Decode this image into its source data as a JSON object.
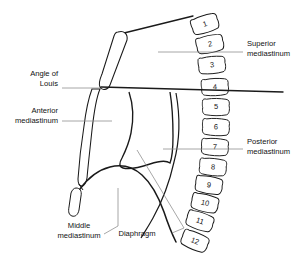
{
  "diagram": {
    "stroke_color": "#1a1a1a",
    "leader_color": "#8a8a8a",
    "background": "#ffffff",
    "vertebrae": [
      {
        "label": "1",
        "cx": 205,
        "cy": 24,
        "rot": -18
      },
      {
        "label": "2",
        "cx": 210,
        "cy": 44,
        "rot": -12
      },
      {
        "label": "3",
        "cx": 212,
        "cy": 65,
        "rot": -6
      },
      {
        "label": "4",
        "cx": 215,
        "cy": 87,
        "rot": -3
      },
      {
        "label": "5",
        "cx": 216,
        "cy": 107,
        "rot": 0
      },
      {
        "label": "6",
        "cx": 216,
        "cy": 127,
        "rot": 2
      },
      {
        "label": "7",
        "cx": 215,
        "cy": 147,
        "rot": 3
      },
      {
        "label": "8",
        "cx": 213,
        "cy": 167,
        "rot": 5
      },
      {
        "label": "9",
        "cx": 209,
        "cy": 185,
        "rot": 9
      },
      {
        "label": "10",
        "cx": 205,
        "cy": 203,
        "rot": 13
      },
      {
        "label": "11",
        "cx": 200,
        "cy": 221,
        "rot": 18
      },
      {
        "label": "12",
        "cx": 195,
        "cy": 241,
        "rot": 22
      }
    ],
    "annotations": [
      {
        "name": "superior-mediastinum",
        "lines": [
          "Superior",
          "mediastinum"
        ],
        "text_x": 247,
        "text_y": 46,
        "align": "start",
        "leader": [
          [
            158,
            52
          ],
          [
            243,
            52
          ]
        ]
      },
      {
        "name": "posterior-mediastinum",
        "lines": [
          "Posterior",
          "mediastinum"
        ],
        "text_x": 247,
        "text_y": 144,
        "align": "start",
        "leader": [
          [
            163,
            149
          ],
          [
            243,
            149
          ]
        ]
      },
      {
        "name": "angle-of-louis",
        "lines": [
          "Angle of",
          "Louis"
        ],
        "text_x": 58,
        "text_y": 76,
        "align": "end",
        "leader": [
          [
            62,
            88
          ],
          [
            100,
            88
          ]
        ]
      },
      {
        "name": "anterior-mediastinum",
        "lines": [
          "Anterior",
          "mediastinum"
        ],
        "text_x": 58,
        "text_y": 113,
        "align": "end",
        "leader": [
          [
            62,
            121
          ],
          [
            112,
            121
          ]
        ]
      },
      {
        "name": "middle-mediastinum",
        "lines": [
          "Middle",
          "mediastinum"
        ],
        "text_x": 79,
        "text_y": 228,
        "align": "middle",
        "leader": [
          [
            104,
            234
          ],
          [
            118,
            226
          ],
          [
            118,
            188
          ]
        ]
      },
      {
        "name": "diaphragm",
        "lines": [
          "Diaphragm"
        ],
        "text_x": 137,
        "text_y": 236,
        "align": "middle",
        "leader": [
          [
            172,
            233
          ],
          [
            184,
            228
          ],
          [
            137,
            150
          ]
        ]
      }
    ]
  }
}
